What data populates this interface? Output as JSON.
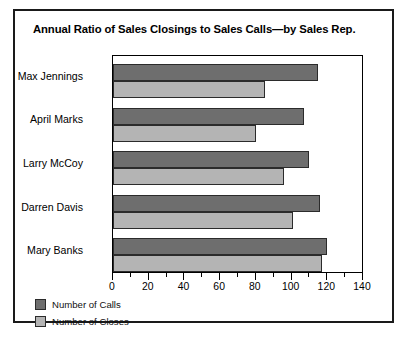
{
  "figure": {
    "title": "Annual Ratio of Sales Closings to Sales Calls—by Sales Rep."
  },
  "legend": {
    "position": "bottom-left",
    "items": [
      {
        "label": "Number of Calls",
        "color": "#6e6e6e",
        "key": "calls"
      },
      {
        "label": "Number of Closes",
        "color": "#b4b4b4",
        "key": "closes"
      }
    ]
  },
  "axis": {
    "x_ticks": [
      "0",
      "20",
      "40",
      "60",
      "80",
      "100",
      "120",
      "140"
    ],
    "x_minor_step": 10
  },
  "chart_data": {
    "type": "bar",
    "orientation": "horizontal",
    "title": "Annual Ratio of Sales Closings to Sales Calls—by Sales Rep.",
    "xlabel": "",
    "ylabel": "",
    "xlim": [
      0,
      140
    ],
    "grid": false,
    "legend_position": "bottom-left",
    "categories": [
      "Max Jennings",
      "April Marks",
      "Larry McCoy",
      "Darren Davis",
      "Mary Banks"
    ],
    "series": [
      {
        "name": "Number of Calls",
        "color": "#6e6e6e",
        "values": [
          115,
          107,
          110,
          116,
          120
        ]
      },
      {
        "name": "Number of Closes",
        "color": "#b4b4b4",
        "values": [
          85,
          80,
          96,
          101,
          117
        ]
      }
    ]
  }
}
